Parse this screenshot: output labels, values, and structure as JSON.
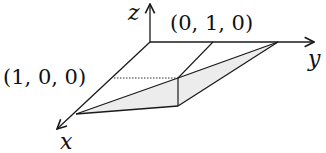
{
  "diagram": {
    "axes": {
      "x_label": "x",
      "y_label": "y",
      "z_label": "z"
    },
    "points": {
      "p100_label": "(1, 0, 0)",
      "p010_label": "(0, 1, 0)"
    },
    "colors": {
      "stroke": "#1a1a1a",
      "fill": "#efefef",
      "background": "#ffffff"
    }
  }
}
